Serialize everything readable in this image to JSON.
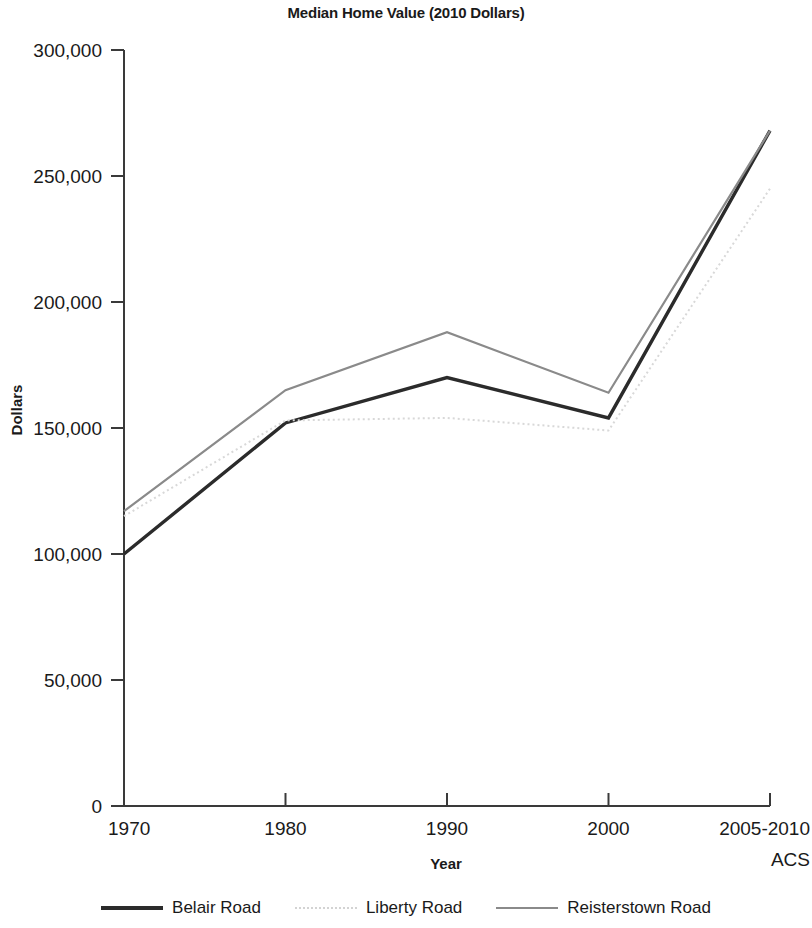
{
  "chart_data": {
    "type": "line",
    "title": "Median Home Value (2010 Dollars)",
    "xlabel": "Year",
    "ylabel": "Dollars",
    "categories": [
      "1970",
      "1980",
      "1990",
      "2000",
      "2005-2010 ACS"
    ],
    "tick_labels_x": [
      "1970",
      "1980",
      "1990",
      "2000",
      "2005-2010"
    ],
    "tick_label_x_last_line2": "ACS",
    "tick_labels_y": [
      "0",
      "50,000",
      "100,000",
      "150,000",
      "200,000",
      "250,000",
      "300,000"
    ],
    "yticks": [
      0,
      50000,
      100000,
      150000,
      200000,
      250000,
      300000
    ],
    "ylim": [
      0,
      300000
    ],
    "grid": false,
    "legend_position": "bottom",
    "series": [
      {
        "name": "Belair Road",
        "color": "#2b2b2b",
        "style": "solid",
        "width": 3.4,
        "values": [
          100000,
          152000,
          170000,
          154000,
          268000
        ]
      },
      {
        "name": "Liberty Road",
        "color": "#d8d8d8",
        "style": "dotted",
        "width": 2.0,
        "values": [
          115000,
          153000,
          154000,
          149000,
          245000
        ]
      },
      {
        "name": "Reisterstown Road",
        "color": "#8a8a8a",
        "style": "solid",
        "width": 2.2,
        "values": [
          117000,
          165000,
          188000,
          164000,
          268000
        ]
      }
    ]
  },
  "legend": {
    "items": [
      {
        "label": "Belair Road",
        "swatch": "legend-line-belair"
      },
      {
        "label": "Liberty Road",
        "swatch": "legend-line-liberty"
      },
      {
        "label": "Reisterstown Road",
        "swatch": "legend-line-reisterstown"
      }
    ]
  }
}
